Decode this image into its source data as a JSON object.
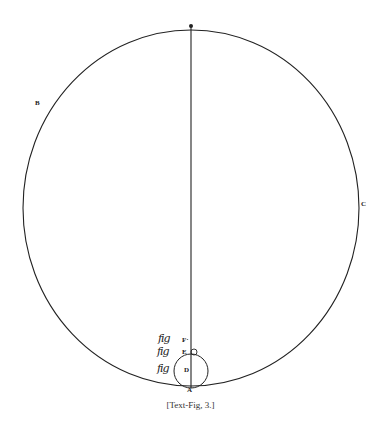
{
  "figure": {
    "caption": "[Text-Fig, 3.]",
    "colors": {
      "ink": "#222222",
      "background": "#ffffff"
    },
    "labels": {
      "top_point": "",
      "B": "B",
      "C": "C",
      "F": "F·",
      "E": "E",
      "D": "D",
      "A": "A"
    },
    "marginal_glyphs": [
      "ℱ𝓎",
      "ℱ𝓎",
      "ℱ𝓎"
    ],
    "marginal_glyph_text": "fig",
    "shapes": {
      "large_circle": {
        "cx": 191,
        "cy": 208,
        "rx": 168,
        "ry": 178
      },
      "diameter_line": {
        "x": 191,
        "y1": 26,
        "y2": 388
      },
      "circle_D": {
        "cx": 191,
        "cy": 371,
        "r": 17
      },
      "circle_E": {
        "cx": 193,
        "cy": 352,
        "r": 3
      }
    }
  }
}
